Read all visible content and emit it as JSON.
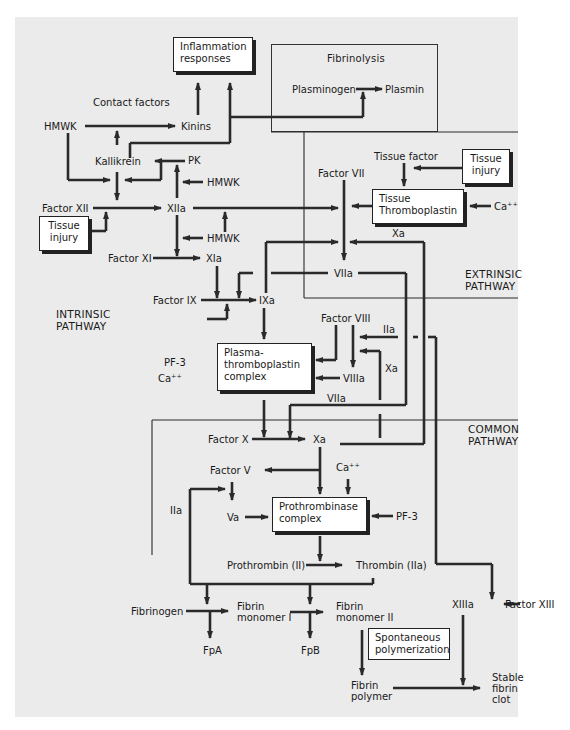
{
  "diagram": {
    "type": "coagulation-cascade",
    "regions": {
      "fibrinolysis": "Fibrinolysis",
      "extrinsic": [
        "EXTRINSIC",
        "PATHWAY"
      ],
      "intrinsic": [
        "INTRINSIC",
        "PATHWAY"
      ],
      "common": [
        "COMMON",
        "PATHWAY"
      ]
    },
    "boxes": {
      "inflammation": [
        "Inflammation",
        "responses"
      ],
      "tissue_injury_left": [
        "Tissue",
        "injury"
      ],
      "tissue_injury_right": [
        "Tissue",
        "injury"
      ],
      "tissue_thromboplastin": [
        "Tissue",
        "Thromboplastin"
      ],
      "plasma_thromboplastin": [
        "Plasma-",
        "thromboplastin",
        "complex"
      ],
      "prothrombinase": [
        "Prothrombinase",
        "complex"
      ],
      "spontaneous": [
        "Spontaneous",
        "polymerization"
      ]
    },
    "labels": {
      "contact_factors": "Contact factors",
      "hmwk_top": "HMWK",
      "kinins": "Kinins",
      "kallikrein": "Kallikrein",
      "pk": "PK",
      "hmwk_mid": "HMWK",
      "factor_xii": "Factor XII",
      "xiia": "XIIa",
      "hmwk_low": "HMWK",
      "factor_xi": "Factor XI",
      "xia": "XIa",
      "factor_ix": "Factor IX",
      "ixa": "IXa",
      "plasminogen": "Plasminogen",
      "plasmin": "Plasmin",
      "tissue_factor": "Tissue factor",
      "factor_vii": "Factor VII",
      "ca_ext": "Ca⁺⁺",
      "xa_ext": "Xa",
      "viia_top": "VIIa",
      "factor_viii": "Factor VIII",
      "iia_viii": "IIa",
      "xa_viii": "Xa",
      "viiia": "VIIIa",
      "viia_low": "VIIa",
      "pf3_left": "PF-3",
      "ca_left": "Ca⁺⁺",
      "factor_x": "Factor X",
      "xa_common": "Xa",
      "factor_v": "Factor V",
      "ca_common": "Ca⁺⁺",
      "iia_left": "IIa",
      "va": "Va",
      "pf3_right": "PF-3",
      "prothrombin": "Prothrombin (II)",
      "thrombin": "Thrombin (IIa)",
      "fibrinogen": "Fibrinogen",
      "fibrin_monomer_i": [
        "Fibrin",
        "monomer I"
      ],
      "fibrin_monomer_ii": [
        "Fibrin",
        "monomer II"
      ],
      "fpa": "FpA",
      "fpb": "FpB",
      "xiiia": "XIIIa",
      "factor_xiii": "Factor XIII",
      "fibrin_polymer": [
        "Fibrin",
        "polymer"
      ],
      "stable_clot": [
        "Stable",
        "fibrin",
        "clot"
      ]
    },
    "colors": {
      "background": "#ebebeb",
      "page": "#ffffff",
      "ink": "#2a2a2a",
      "box_fill": "#ffffff"
    }
  }
}
